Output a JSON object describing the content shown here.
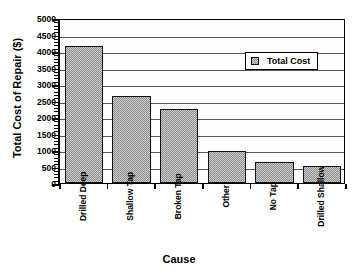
{
  "chart_data": {
    "type": "bar",
    "title": "",
    "xlabel": "Cause",
    "ylabel": "Total Cost of Repair ($)",
    "categories": [
      "Drilled Deep",
      "Shallow Tap",
      "Broken Tap",
      "Other",
      "No Tap",
      "Drilled Shallow"
    ],
    "values": [
      4150,
      2630,
      2250,
      960,
      625,
      510
    ],
    "series": [
      {
        "name": "Total Cost",
        "values": [
          4150,
          2630,
          2250,
          960,
          625,
          510
        ]
      }
    ],
    "ylim": [
      0,
      5000
    ],
    "ytick_labels": [
      "0",
      "500",
      "1000",
      "1500",
      "2000",
      "2500",
      "3000",
      "3500",
      "4000",
      "4500",
      "5000"
    ],
    "ytick_values": [
      0,
      500,
      1000,
      1500,
      2000,
      2500,
      3000,
      3500,
      4000,
      4500,
      5000
    ],
    "y_minor_ticks": true,
    "grid": true,
    "grid_axis": "y",
    "legend": {
      "position": "top-right-inside",
      "entries": [
        "Total Cost"
      ]
    },
    "bar_color": "#8e8e8e",
    "bar_edge_color": "#111111",
    "axis_color": "#000000",
    "grid_color": "#555555",
    "background_color": "#ffffff"
  },
  "legend": {
    "swatch_name": "total-cost-swatch",
    "label": "Total Cost"
  },
  "axes": {
    "y_title": "Total Cost of Repair ($)",
    "x_title": "Cause"
  }
}
